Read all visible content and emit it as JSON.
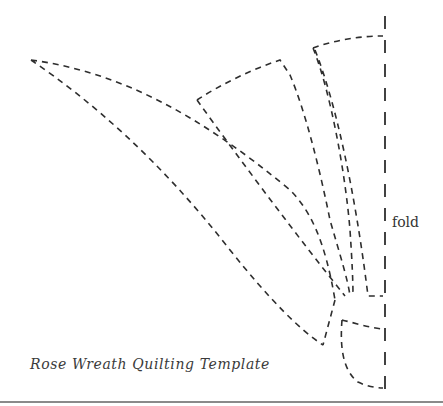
{
  "diagram": {
    "title": "Rose Wreath Quilting Template",
    "fold_label": "fold",
    "line_color": "#2e2e2e",
    "background": "#ffffff",
    "pieces": [
      {
        "name": "long-leaf-piece",
        "description": "long curved leaf shape extending to upper left"
      },
      {
        "name": "middle-petal-piece",
        "description": "wedge-shaped petal with curved top edge"
      },
      {
        "name": "upper-petal-piece",
        "description": "narrow wedge petal meeting fold line at top"
      },
      {
        "name": "small-base-piece",
        "description": "small rounded piece at bottom on fold"
      }
    ]
  }
}
